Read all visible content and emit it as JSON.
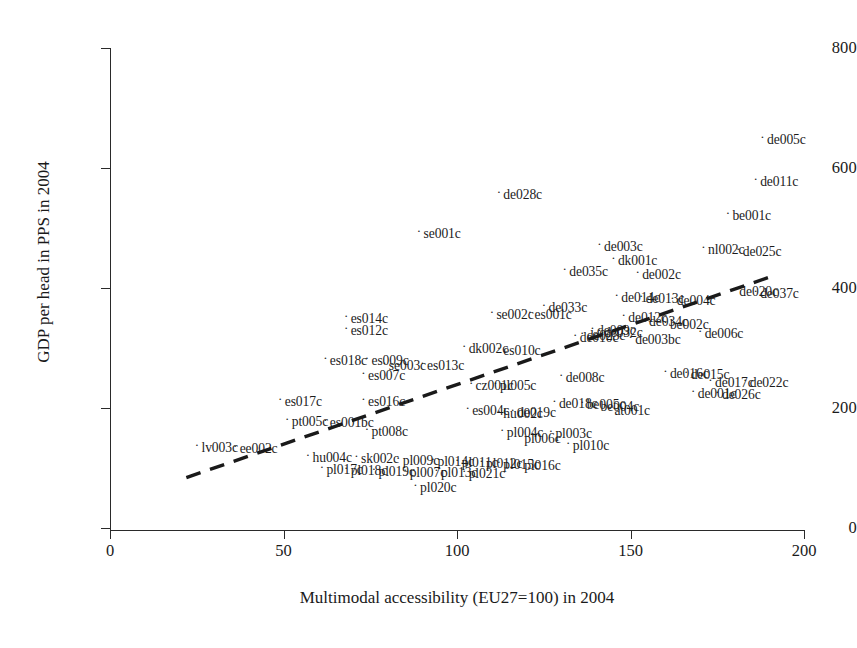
{
  "chart_data": {
    "type": "scatter",
    "title": "",
    "xlabel": "Multimodal accessibility (EU27=100) in 2004",
    "ylabel": "GDP per head in PPS in 2004",
    "xlim": [
      0,
      200
    ],
    "ylim": [
      0,
      800
    ],
    "xticks": [
      0,
      50,
      100,
      150,
      200
    ],
    "yticks": [
      0,
      200,
      400,
      600,
      800
    ],
    "grid": false,
    "legend": null,
    "marker": "dot-with-right-label",
    "trendline": {
      "style": "dashed",
      "color": "#1a1a1a",
      "x_start": 22,
      "y_start": 84,
      "x_end": 191,
      "y_end": 420
    },
    "points": [
      {
        "label": "de005c",
        "x": 188,
        "y": 648
      },
      {
        "label": "de011c",
        "x": 186,
        "y": 578
      },
      {
        "label": "be001c",
        "x": 178,
        "y": 521
      },
      {
        "label": "de028c",
        "x": 112,
        "y": 556
      },
      {
        "label": "se001c",
        "x": 89,
        "y": 492
      },
      {
        "label": "de003c",
        "x": 141,
        "y": 470
      },
      {
        "label": "nl002c",
        "x": 171,
        "y": 465
      },
      {
        "label": "de025c",
        "x": 181,
        "y": 461
      },
      {
        "label": "dk001c",
        "x": 145,
        "y": 447
      },
      {
        "label": "de035c",
        "x": 131,
        "y": 428
      },
      {
        "label": "de002c",
        "x": 152,
        "y": 424
      },
      {
        "label": "de020c",
        "x": 180,
        "y": 395
      },
      {
        "label": "de037c",
        "x": 186,
        "y": 392
      },
      {
        "label": "de014c",
        "x": 146,
        "y": 385
      },
      {
        "label": "de013c",
        "x": 153,
        "y": 383
      },
      {
        "label": "de004c",
        "x": 162,
        "y": 380
      },
      {
        "label": "de033c",
        "x": 125,
        "y": 369
      },
      {
        "label": "se002c",
        "x": 110,
        "y": 356
      },
      {
        "label": "es001c",
        "x": 121,
        "y": 356
      },
      {
        "label": "es014c",
        "x": 68,
        "y": 350
      },
      {
        "label": "de012c",
        "x": 148,
        "y": 352
      },
      {
        "label": "de034c",
        "x": 154,
        "y": 345
      },
      {
        "label": "be002c",
        "x": 160,
        "y": 340
      },
      {
        "label": "es012c",
        "x": 68,
        "y": 330
      },
      {
        "label": "de006c",
        "x": 170,
        "y": 325
      },
      {
        "label": "de009c",
        "x": 139,
        "y": 330
      },
      {
        "label": "de032c",
        "x": 141,
        "y": 327
      },
      {
        "label": "de023c",
        "x": 136,
        "y": 322
      },
      {
        "label": "de010c",
        "x": 134,
        "y": 318
      },
      {
        "label": "de003bc",
        "x": 150,
        "y": 315
      },
      {
        "label": "dk002c",
        "x": 102,
        "y": 300
      },
      {
        "label": "es010c",
        "x": 112,
        "y": 297
      },
      {
        "label": "es018c",
        "x": 62,
        "y": 280
      },
      {
        "label": "es009c",
        "x": 74,
        "y": 280
      },
      {
        "label": "se003c",
        "x": 79,
        "y": 272
      },
      {
        "label": "es013c",
        "x": 90,
        "y": 271
      },
      {
        "label": "de016c",
        "x": 160,
        "y": 258
      },
      {
        "label": "de015c",
        "x": 166,
        "y": 256
      },
      {
        "label": "de017c",
        "x": 173,
        "y": 243
      },
      {
        "label": "de022c",
        "x": 183,
        "y": 243
      },
      {
        "label": "es007c",
        "x": 73,
        "y": 255
      },
      {
        "label": "de008c",
        "x": 130,
        "y": 251
      },
      {
        "label": "cz001c",
        "x": 104,
        "y": 238
      },
      {
        "label": "pl005c",
        "x": 111,
        "y": 238
      },
      {
        "label": "de001c",
        "x": 168,
        "y": 225
      },
      {
        "label": "de026c",
        "x": 175,
        "y": 224
      },
      {
        "label": "es017c",
        "x": 49,
        "y": 211
      },
      {
        "label": "es016c",
        "x": 73,
        "y": 211
      },
      {
        "label": "de018c",
        "x": 128,
        "y": 208
      },
      {
        "label": "be005c",
        "x": 136,
        "y": 206
      },
      {
        "label": "be004c",
        "x": 140,
        "y": 203
      },
      {
        "label": "at001c",
        "x": 144,
        "y": 197
      },
      {
        "label": "es004c",
        "x": 103,
        "y": 196
      },
      {
        "label": "de019c",
        "x": 116,
        "y": 193
      },
      {
        "label": "hu002c",
        "x": 112,
        "y": 191
      },
      {
        "label": "pt005c",
        "x": 51,
        "y": 178
      },
      {
        "label": "es001bc",
        "x": 62,
        "y": 176
      },
      {
        "label": "pt008c",
        "x": 74,
        "y": 161
      },
      {
        "label": "pl004c",
        "x": 113,
        "y": 160
      },
      {
        "label": "pl003c",
        "x": 127,
        "y": 158
      },
      {
        "label": "pl006c",
        "x": 118,
        "y": 150
      },
      {
        "label": "lv003c",
        "x": 25,
        "y": 135
      },
      {
        "label": "ee002c",
        "x": 36,
        "y": 133
      },
      {
        "label": "pl010c",
        "x": 132,
        "y": 138
      },
      {
        "label": "hu004c",
        "x": 57,
        "y": 118
      },
      {
        "label": "sk002c",
        "x": 71,
        "y": 117
      },
      {
        "label": "pl009c",
        "x": 83,
        "y": 114
      },
      {
        "label": "pl014c",
        "x": 93,
        "y": 112
      },
      {
        "label": "pl011c",
        "x": 100,
        "y": 110
      },
      {
        "label": "pl012c",
        "x": 107,
        "y": 108
      },
      {
        "label": "pl015c",
        "x": 112,
        "y": 106
      },
      {
        "label": "pl016c",
        "x": 118,
        "y": 105
      },
      {
        "label": "pl017c",
        "x": 61,
        "y": 99
      },
      {
        "label": "pl018c",
        "x": 68,
        "y": 97
      },
      {
        "label": "pl019c",
        "x": 76,
        "y": 95
      },
      {
        "label": "pl007c",
        "x": 85,
        "y": 94
      },
      {
        "label": "pl013c",
        "x": 94,
        "y": 93
      },
      {
        "label": "pl021c",
        "x": 102,
        "y": 92
      },
      {
        "label": "pl020c",
        "x": 88,
        "y": 68
      }
    ]
  },
  "axis": {
    "y_title": "GDP per head in PPS in 2004",
    "x_title": "Multimodal accessibility (EU27=100) in 2004",
    "x_tick_labels": [
      "0",
      "50",
      "100",
      "150",
      "200"
    ],
    "y_tick_labels": [
      "0",
      "200",
      "400",
      "600",
      "800"
    ]
  },
  "colors": {
    "axis": "#2a2a2a",
    "text": "#1a1a1a",
    "point": "#1c1c1c",
    "trendline": "#1a1a1a",
    "background": "#ffffff"
  }
}
